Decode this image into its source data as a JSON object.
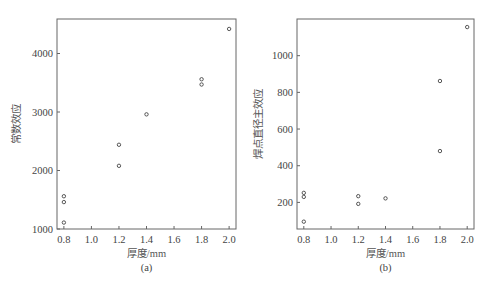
{
  "chart_data": [
    {
      "type": "scatter",
      "panel_label": "(a)",
      "title": "",
      "xlabel": "厚度/mm",
      "ylabel": "常数效应",
      "xlim": [
        0.75,
        2.05
      ],
      "ylim": [
        1000,
        4590
      ],
      "xticks": [
        0.8,
        1.0,
        1.2,
        1.4,
        1.6,
        1.8,
        2.0
      ],
      "xtick_labels": [
        "0.8",
        "1.0",
        "1.2",
        "1.4",
        "1.6",
        "1.8",
        "2.0"
      ],
      "yticks": [
        1000,
        2000,
        3000,
        4000
      ],
      "ytick_labels": [
        "1000",
        "2000",
        "3000",
        "4000"
      ],
      "grid": false,
      "marker": "open-circle",
      "points": [
        {
          "x": 0.8,
          "y": 1560
        },
        {
          "x": 0.8,
          "y": 1460
        },
        {
          "x": 0.8,
          "y": 1110
        },
        {
          "x": 1.2,
          "y": 2440
        },
        {
          "x": 1.2,
          "y": 2080
        },
        {
          "x": 1.4,
          "y": 2960
        },
        {
          "x": 1.8,
          "y": 3560
        },
        {
          "x": 1.8,
          "y": 3470
        },
        {
          "x": 2.0,
          "y": 4420
        }
      ]
    },
    {
      "type": "scatter",
      "panel_label": "(b)",
      "title": "",
      "xlabel": "厚度/mm",
      "ylabel": "焊点直径主效应",
      "xlim": [
        0.75,
        2.05
      ],
      "ylim": [
        55,
        1200
      ],
      "xticks": [
        0.8,
        1.0,
        1.2,
        1.4,
        1.6,
        1.8,
        2.0
      ],
      "xtick_labels": [
        "0.8",
        "1.0",
        "1.2",
        "1.4",
        "1.6",
        "1.8",
        "2.0"
      ],
      "yticks": [
        200,
        400,
        600,
        800,
        1000
      ],
      "ytick_labels": [
        "200",
        "400",
        "600",
        "800",
        "1000"
      ],
      "grid": false,
      "marker": "open-circle",
      "points": [
        {
          "x": 0.8,
          "y": 252
        },
        {
          "x": 0.8,
          "y": 230
        },
        {
          "x": 0.8,
          "y": 95
        },
        {
          "x": 1.2,
          "y": 234
        },
        {
          "x": 1.2,
          "y": 192
        },
        {
          "x": 1.4,
          "y": 222
        },
        {
          "x": 1.8,
          "y": 862
        },
        {
          "x": 1.8,
          "y": 480
        },
        {
          "x": 2.0,
          "y": 1156
        }
      ]
    }
  ],
  "layout": {
    "panels": [
      {
        "frame": {
          "left": 57,
          "top": 19,
          "right": 236,
          "bottom": 229
        },
        "ylabel_x": 20
      },
      {
        "frame": {
          "left": 297,
          "top": 19,
          "right": 474,
          "bottom": 229
        },
        "ylabel_x": 262
      }
    ],
    "colors": {
      "axis": "#666666",
      "marker": "#444444",
      "text": "#444444"
    }
  }
}
